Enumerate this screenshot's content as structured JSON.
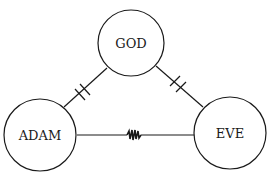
{
  "diagram": {
    "nodes": [
      {
        "id": "god",
        "label": "GOD"
      },
      {
        "id": "adam",
        "label": "ADAM"
      },
      {
        "id": "eve",
        "label": "EVE"
      }
    ],
    "edges": [
      {
        "from": "god",
        "to": "adam",
        "style": "cut (double bar)"
      },
      {
        "from": "god",
        "to": "eve",
        "style": "cut (double bar)"
      },
      {
        "from": "adam",
        "to": "eve",
        "style": "conflict (zigzag)"
      }
    ],
    "colors": {
      "stroke": "#1a1a1a",
      "background": "#ffffff"
    }
  }
}
